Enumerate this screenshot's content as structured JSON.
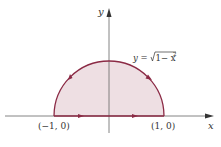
{
  "diagram": {
    "axes": {
      "x_label": "x",
      "y_label": "y"
    },
    "curve": {
      "equation_lhs": "y =",
      "equation_radical": "1− x",
      "equation_exponent": "2",
      "equation_full": "y = √(1 − x²)"
    },
    "points": [
      {
        "label": "(−1, 0)"
      },
      {
        "label": "(1, 0)"
      }
    ],
    "colors": {
      "region_fill": "#eedfe3",
      "boundary_stroke": "#8b2a45",
      "axis_stroke": "#555555"
    }
  }
}
